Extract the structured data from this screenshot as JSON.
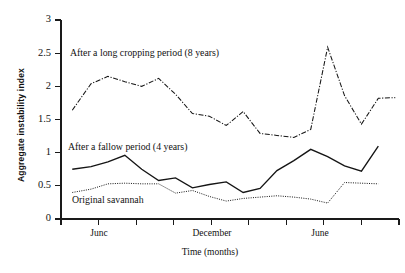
{
  "chart_data": {
    "type": "line",
    "title": "",
    "xlabel": "Time (months)",
    "ylabel": "Aggregate instability index",
    "ylim": [
      0,
      3
    ],
    "yticks": [
      0,
      0.5,
      1,
      1.5,
      2,
      2.5,
      3
    ],
    "ytick_labels": [
      "0",
      "0.5",
      "1",
      "1.5",
      "2",
      "2.5",
      "3"
    ],
    "xlim": [
      0,
      18
    ],
    "xticks": [
      0,
      2,
      4,
      6,
      8,
      10,
      12,
      14,
      16,
      18
    ],
    "xtick_labels": [
      "",
      "Junc",
      "",
      "",
      "December",
      "",
      "",
      "June",
      "",
      ""
    ],
    "grid": false,
    "legend_position": "inline-annotations",
    "x": [
      0.6,
      1.6,
      2.5,
      3.4,
      4.3,
      5.2,
      6.1,
      7.0,
      7.9,
      8.8,
      9.7,
      10.6,
      11.5,
      12.4,
      13.3,
      14.2,
      15.1,
      16.0,
      16.9,
      17.8
    ],
    "series": [
      {
        "name": "After a long cropping period (8 years)",
        "style": "dash-dot",
        "label": "After a long cropping period (8 years)",
        "values": [
          1.64,
          2.04,
          2.15,
          2.07,
          2.0,
          2.12,
          1.88,
          1.59,
          1.55,
          1.41,
          1.62,
          1.29,
          1.26,
          1.23,
          1.35,
          2.59,
          1.86,
          1.43,
          1.82,
          1.83
        ]
      },
      {
        "name": "After a fallow period (4 years)",
        "style": "solid",
        "label": "After a fallow period (4 years)",
        "values": [
          0.75,
          0.79,
          0.86,
          0.96,
          0.75,
          0.58,
          0.62,
          0.47,
          0.52,
          0.56,
          0.4,
          0.46,
          0.73,
          0.88,
          1.05,
          0.94,
          0.8,
          0.72,
          1.1,
          null
        ]
      },
      {
        "name": "Original savannah",
        "style": "dotted",
        "label": "Original savannah",
        "values": [
          0.4,
          0.45,
          0.53,
          0.54,
          0.53,
          0.53,
          0.39,
          0.43,
          0.34,
          0.27,
          0.31,
          0.33,
          0.35,
          0.33,
          0.3,
          0.24,
          0.55,
          0.54,
          0.53,
          null
        ]
      }
    ],
    "annotations": [
      {
        "text": "After a long cropping period (8 years)",
        "x_px": 70,
        "y_px": 56
      },
      {
        "text": "After a fallow period (4 years)",
        "x_px": 68,
        "y_px": 150
      },
      {
        "text": "Original savannah",
        "x_px": 72,
        "y_px": 203
      }
    ],
    "colors": {
      "line": "#151515",
      "axis": "#1a1a1a",
      "background": "#ffffff"
    }
  }
}
